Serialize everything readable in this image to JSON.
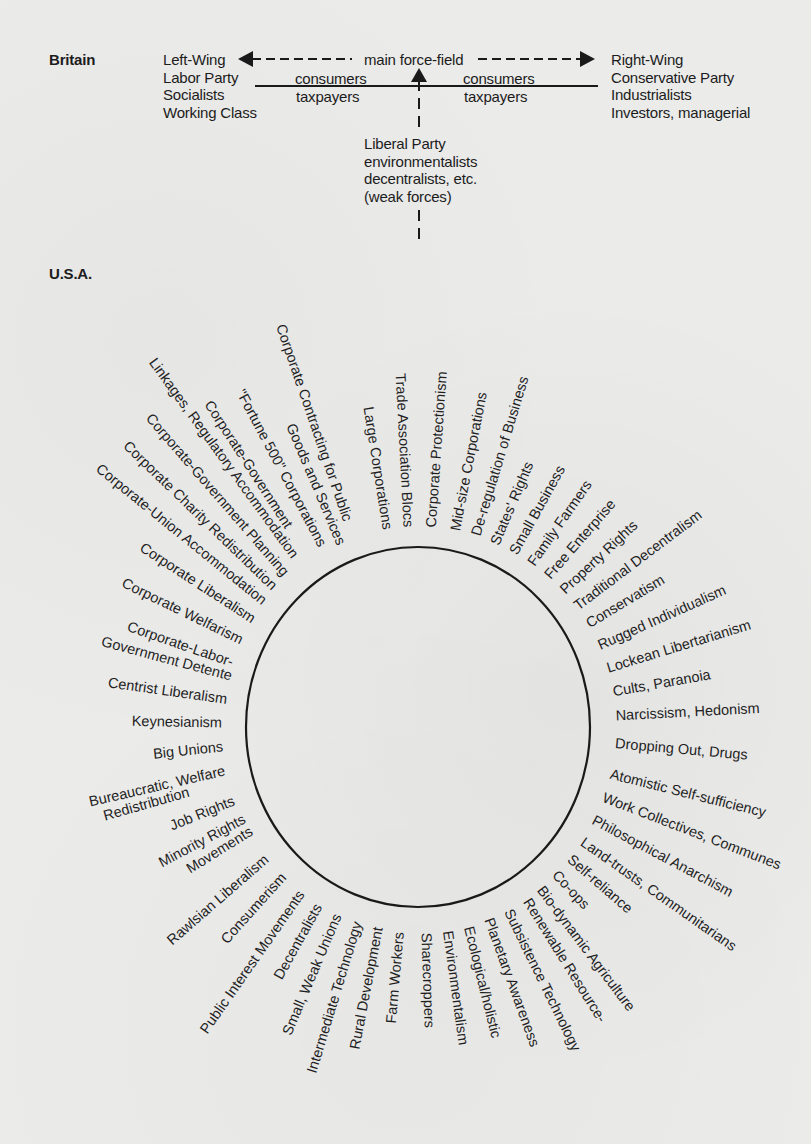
{
  "britain": {
    "section_label": "Britain",
    "left": [
      "Left-Wing",
      "Labor Party",
      "Socialists",
      "Working Class"
    ],
    "right": [
      "Right-Wing",
      "Conservative Party",
      "Industrialists",
      "Investors, managerial"
    ],
    "main_axis_label": "main force-field",
    "consumers_left": "consumers",
    "taxpayers_left": "taxpayers",
    "consumers_right": "consumers",
    "taxpayers_right": "taxpayers",
    "weak_forces": [
      "Liberal Party",
      "environmentalists",
      "decentralists, etc.",
      "(weak forces)"
    ]
  },
  "usa": {
    "section_label": "U.S.A.",
    "circle": {
      "cx": 418,
      "cy": 727,
      "rx": 172,
      "ry": 180,
      "stroke": "#1a1a1a"
    },
    "labels": [
      {
        "text": "Trade Association Blocs",
        "angle": -93,
        "r": 200
      },
      {
        "text": "Large Corporations",
        "angle": -99,
        "r": 200
      },
      {
        "text": "Corporate Contracting for Public",
        "angle": -109,
        "r": 218
      },
      {
        "text": "Goods and Services",
        "angle": -113,
        "r": 198
      },
      {
        "text": "\"Fortune 500\" Corporations",
        "angle": -118,
        "r": 205
      },
      {
        "text": "Corporate-Government",
        "angle": -123,
        "r": 238
      },
      {
        "text": "Linkages, Regulatory Accommodation",
        "angle": -126,
        "r": 210
      },
      {
        "text": "Corporate-Government Planning",
        "angle": -131,
        "r": 202
      },
      {
        "text": "Corporate Charity Redistribution",
        "angle": -136,
        "r": 200
      },
      {
        "text": "Corporate-Union Accommodation",
        "angle": -141,
        "r": 198
      },
      {
        "text": "Corporate Liberalism",
        "angle": -147,
        "r": 196
      },
      {
        "text": "Corporate Welfarism",
        "angle": -154,
        "r": 196
      },
      {
        "text": "Corporate-Labor-",
        "angle": -161,
        "r": 196
      },
      {
        "text": "Government Detente",
        "angle": -165,
        "r": 193
      },
      {
        "text": "Centrist Liberalism",
        "angle": -172,
        "r": 193
      },
      {
        "text": "Keynesianism",
        "angle": -179,
        "r": 196
      },
      {
        "text": "Big Unions",
        "angle": 174,
        "r": 196
      },
      {
        "text": "Bureaucratic, Welfare",
        "angle": 167,
        "r": 198
      },
      {
        "text": "Redistribution",
        "angle": 164,
        "r": 238
      },
      {
        "text": "Job Rights",
        "angle": 158,
        "r": 198
      },
      {
        "text": "Minority Rights",
        "angle": 152,
        "r": 196
      },
      {
        "text": "Movements",
        "angle": 148,
        "r": 196
      },
      {
        "text": "Rawlsian Liberalism",
        "angle": 139,
        "r": 200
      },
      {
        "text": "Consumerism",
        "angle": 132,
        "r": 200
      },
      {
        "text": "Public Interest Movements",
        "angle": 125,
        "r": 202
      },
      {
        "text": "Decentralists",
        "angle": 119,
        "r": 204
      },
      {
        "text": "Small, Weak Unions",
        "angle": 113,
        "r": 204
      },
      {
        "text": "Intermediate Technology",
        "angle": 107,
        "r": 204
      },
      {
        "text": "Rural Development",
        "angle": 101,
        "r": 204
      },
      {
        "text": "Farm Workers",
        "angle": 95,
        "r": 206
      },
      {
        "text": "Sharecroppers",
        "angle": 88,
        "r": 206
      },
      {
        "text": "Environmentalism",
        "angle": 82,
        "r": 206
      },
      {
        "text": "Ecological/holistic",
        "angle": 76,
        "r": 206
      },
      {
        "text": "Planetary Awareness",
        "angle": 70,
        "r": 204
      },
      {
        "text": "Subsistence Technology",
        "angle": 64,
        "r": 204
      },
      {
        "text": "Renewable Resource-",
        "angle": 58,
        "r": 204
      },
      {
        "text": "Bio-dynamic Agriculture",
        "angle": 53,
        "r": 202
      },
      {
        "text": "Co-ops",
        "angle": 47,
        "r": 200
      },
      {
        "text": "Self-reliance",
        "angle": 41,
        "r": 200
      },
      {
        "text": "Land-trusts, Communitarians",
        "angle": 35,
        "r": 200
      },
      {
        "text": "Philosophical Anarchism",
        "angle": 28,
        "r": 198
      },
      {
        "text": "Work Collectives, Communes",
        "angle": 21,
        "r": 198
      },
      {
        "text": "Atomistic Self-sufficiency",
        "angle": 14,
        "r": 198
      },
      {
        "text": "Dropping Out, Drugs",
        "angle": 5,
        "r": 198
      },
      {
        "text": "Narcissism, Hedonism",
        "angle": -3,
        "r": 198
      },
      {
        "text": "Cults, Paranoia",
        "angle": -10,
        "r": 198
      },
      {
        "text": "Lockean Libertarianism",
        "angle": -17,
        "r": 198
      },
      {
        "text": "Rugged Individualism",
        "angle": -24,
        "r": 198
      },
      {
        "text": "Conservatism",
        "angle": -31,
        "r": 198
      },
      {
        "text": "Traditional Decentralism",
        "angle": -37,
        "r": 198
      },
      {
        "text": "Property Rights",
        "angle": -43,
        "r": 198
      },
      {
        "text": "Free Enterprise",
        "angle": -49,
        "r": 198
      },
      {
        "text": "Family Farmers",
        "angle": -55,
        "r": 198
      },
      {
        "text": "Small Business",
        "angle": -61,
        "r": 198
      },
      {
        "text": "States' Rights",
        "angle": -67,
        "r": 198
      },
      {
        "text": "De-regulation of Business",
        "angle": -73,
        "r": 200
      },
      {
        "text": "Mid-size Corporations",
        "angle": -79,
        "r": 200
      },
      {
        "text": "Corporate Protectionism",
        "angle": -86,
        "r": 200
      }
    ]
  }
}
